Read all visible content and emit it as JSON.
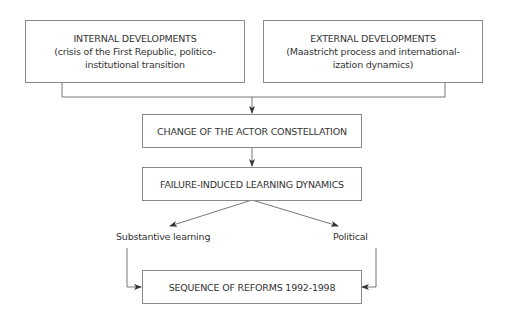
{
  "diagram": {
    "nodes": {
      "internal": {
        "title": "INTERNAL DEVELOPMENTS",
        "line2": "(crisis of the First Republic, politico-",
        "line3": "institutional transition"
      },
      "external": {
        "title": "EXTERNAL DEVELOPMENTS",
        "line2": "(Maastricht process and international-",
        "line3": "ization dynamics)"
      },
      "actor": {
        "title": "CHANGE OF THE ACTOR CONSTELLATION"
      },
      "failure": {
        "title": "FAILURE-INDUCED LEARNING DYNAMICS"
      },
      "reforms": {
        "title": "SEQUENCE OF REFORMS 1992-1998"
      }
    },
    "branch_labels": {
      "left": "Substantive learning",
      "right": "Political"
    },
    "edges": [
      [
        "internal",
        "actor"
      ],
      [
        "external",
        "actor"
      ],
      [
        "actor",
        "failure"
      ],
      [
        "failure",
        "substantive-learning"
      ],
      [
        "failure",
        "political"
      ],
      [
        "substantive-learning",
        "reforms"
      ],
      [
        "political",
        "reforms"
      ]
    ]
  }
}
